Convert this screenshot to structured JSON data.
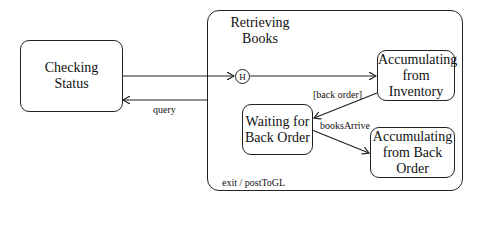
{
  "states": {
    "checking_status": "Checking Status",
    "retrieving_books": "Retrieving Books",
    "accumulating_inventory": "Accumulating from Inventory",
    "waiting_back_order": "Waiting for Back Order",
    "accumulating_back_order": "Accumulating from Back Order"
  },
  "history_marker": "H",
  "transitions": {
    "query": "query",
    "back_order": "[back order]",
    "books_arrive": "booksArrive"
  },
  "exit_action": "exit / postToGL"
}
